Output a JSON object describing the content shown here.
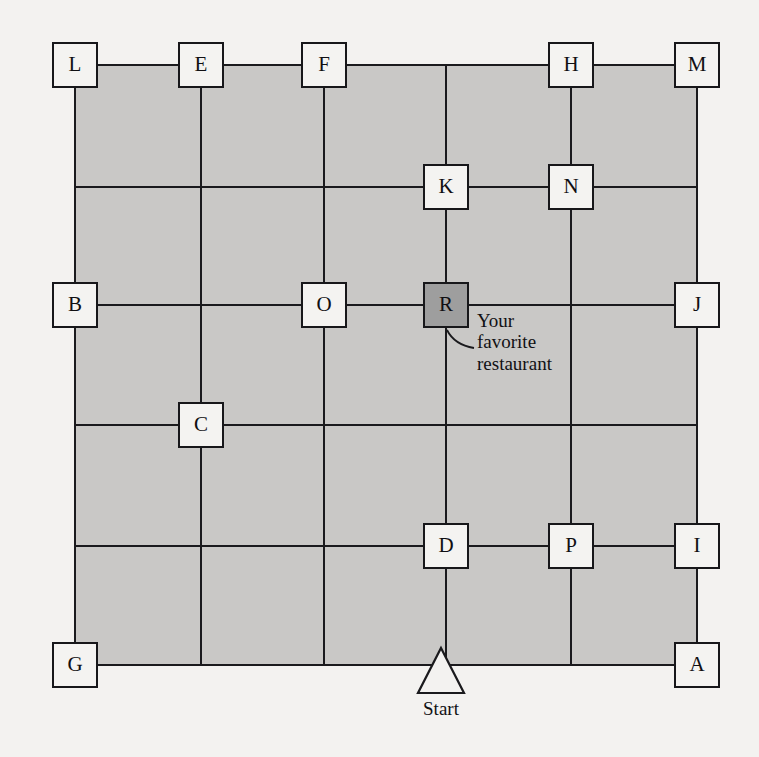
{
  "diagram": {
    "background_color": "#f3f2f0",
    "block_fill_color": "#c9c8c6",
    "line_color": "#1a1a1d",
    "node_fill_color": "#f4f3f1",
    "highlight_fill_color": "#9e9e9e",
    "grid": {
      "vertical_lines_x": [
        75,
        201,
        324,
        446,
        571,
        697
      ],
      "horizontal_lines_y": [
        65,
        187,
        305,
        425,
        546,
        665
      ]
    },
    "nodes": [
      {
        "id": "L",
        "label": "L",
        "x": 75,
        "y": 65,
        "highlighted": false
      },
      {
        "id": "E",
        "label": "E",
        "x": 201,
        "y": 65,
        "highlighted": false
      },
      {
        "id": "F",
        "label": "F",
        "x": 324,
        "y": 65,
        "highlighted": false
      },
      {
        "id": "H",
        "label": "H",
        "x": 571,
        "y": 65,
        "highlighted": false
      },
      {
        "id": "M",
        "label": "M",
        "x": 697,
        "y": 65,
        "highlighted": false
      },
      {
        "id": "K",
        "label": "K",
        "x": 446,
        "y": 187,
        "highlighted": false
      },
      {
        "id": "N",
        "label": "N",
        "x": 571,
        "y": 187,
        "highlighted": false
      },
      {
        "id": "B",
        "label": "B",
        "x": 75,
        "y": 305,
        "highlighted": false
      },
      {
        "id": "O",
        "label": "O",
        "x": 324,
        "y": 305,
        "highlighted": false
      },
      {
        "id": "R",
        "label": "R",
        "x": 446,
        "y": 305,
        "highlighted": true
      },
      {
        "id": "J",
        "label": "J",
        "x": 697,
        "y": 305,
        "highlighted": false
      },
      {
        "id": "C",
        "label": "C",
        "x": 201,
        "y": 425,
        "highlighted": false
      },
      {
        "id": "D",
        "label": "D",
        "x": 446,
        "y": 546,
        "highlighted": false
      },
      {
        "id": "P",
        "label": "P",
        "x": 571,
        "y": 546,
        "highlighted": false
      },
      {
        "id": "I",
        "label": "I",
        "x": 697,
        "y": 546,
        "highlighted": false
      },
      {
        "id": "G",
        "label": "G",
        "x": 75,
        "y": 665,
        "highlighted": false
      },
      {
        "id": "A",
        "label": "A",
        "x": 697,
        "y": 665,
        "highlighted": false
      }
    ],
    "annotation": {
      "text": "Your\nfavorite\nrestaurant",
      "points_to": "R"
    },
    "start_marker": {
      "label": "Start",
      "shape": "triangle",
      "x": 441,
      "y": 670
    }
  }
}
